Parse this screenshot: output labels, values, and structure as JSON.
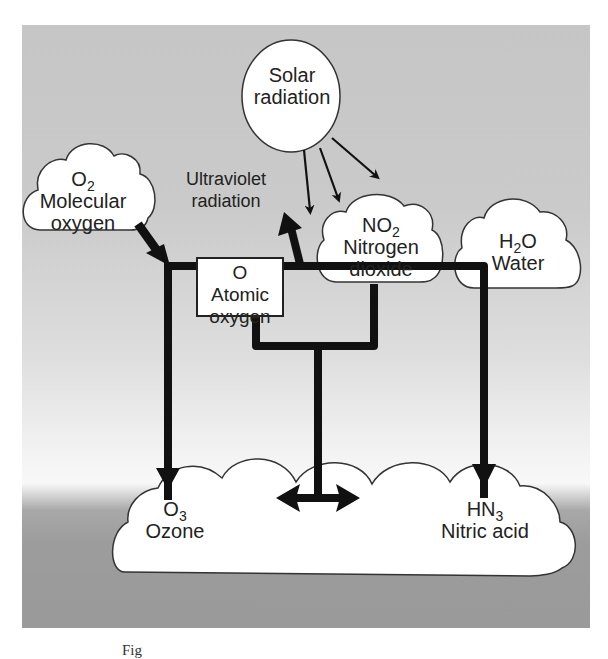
{
  "diagram": {
    "type": "chemical-process-flow",
    "nodes": {
      "solar": {
        "line1": "Solar",
        "line2": "radiation",
        "shape": "circle"
      },
      "uv_label": {
        "line1": "Ultraviolet",
        "line2": "radiation"
      },
      "o2": {
        "formula": "O",
        "sub": "2",
        "name": "Molecular",
        "name2": "oxygen",
        "shape": "cloud"
      },
      "atomic_o": {
        "formula": "O",
        "name": "Atomic",
        "name2": "oxygen",
        "shape": "box"
      },
      "no2": {
        "formula": "NO",
        "sub": "2",
        "name": "Nitrogen",
        "name2": "dioxide",
        "shape": "cloud"
      },
      "h2o": {
        "formula": "H",
        "sub": "2",
        "formula_tail": "O",
        "name": "Water",
        "shape": "cloud"
      },
      "o3": {
        "formula": "O",
        "sub": "3",
        "name": "Ozone",
        "shape": "cloud"
      },
      "hn3": {
        "formula": "HN",
        "sub": "3",
        "name": "Nitric acid",
        "shape": "cloud"
      }
    },
    "edges": [
      {
        "from": "solar",
        "to": "uv",
        "label": "Ultraviolet radiation",
        "count": 3
      },
      {
        "from": "o2",
        "to": "reaction-line"
      },
      {
        "from": "reaction-line",
        "to": "o3"
      },
      {
        "from": "reaction-line",
        "to": "uv-up-arrow"
      },
      {
        "from": "reaction-line",
        "to": "hn3"
      },
      {
        "from": "atomic_o",
        "to": "junction"
      },
      {
        "from": "no2",
        "to": "junction"
      },
      {
        "from": "junction",
        "to": "o3 <-> hn3",
        "bidirectional": true
      }
    ],
    "colors": {
      "line": "#111111",
      "node_fill": "#ffffff",
      "node_stroke": "#333333",
      "bg_top": "#c6c6c6",
      "bg_light": "#f6f6f6",
      "bg_bottom": "#9a9a9a"
    }
  },
  "caption": {
    "text": "Fig"
  }
}
